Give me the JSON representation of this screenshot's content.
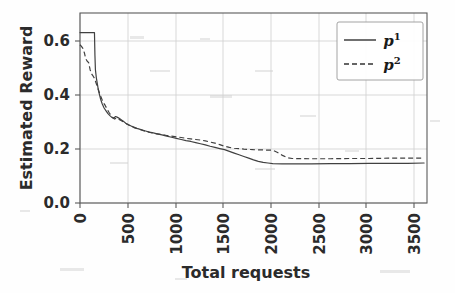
{
  "chart_data": {
    "type": "line",
    "title": "",
    "xlabel": "Total requests",
    "ylabel": "Estimated Reward",
    "xlim": [
      0,
      3600
    ],
    "ylim": [
      0.0,
      0.67
    ],
    "grid": true,
    "legend_position": "upper right",
    "xticks": [
      0,
      500,
      1000,
      1500,
      2000,
      2500,
      3000,
      3500
    ],
    "xtick_labels": [
      "0",
      "500",
      "1000",
      "1500",
      "2000",
      "2500",
      "3000",
      "3500"
    ],
    "yticks": [
      0.0,
      0.2,
      0.4,
      0.6
    ],
    "ytick_labels": [
      "0.0",
      "0.2",
      "0.4",
      "0.6"
    ],
    "xtick_rotation": 90,
    "series": [
      {
        "name": "p1",
        "label_base": "p",
        "label_sup": "1",
        "style": "solid",
        "color": "#404040",
        "x": [
          0,
          20,
          60,
          100,
          140,
          150,
          155,
          160,
          170,
          180,
          190,
          200,
          215,
          230,
          250,
          270,
          290,
          310,
          330,
          350,
          370,
          390,
          410,
          430,
          450,
          480,
          510,
          540,
          570,
          600,
          640,
          680,
          720,
          760,
          800,
          850,
          900,
          950,
          1000,
          1050,
          1100,
          1150,
          1200,
          1250,
          1300,
          1350,
          1400,
          1450,
          1500,
          1550,
          1600,
          1650,
          1700,
          1750,
          1800,
          1850,
          1900,
          1950,
          2000,
          2100,
          2200,
          2400,
          2600,
          2800,
          3000,
          3200,
          3400,
          3570
        ],
        "y": [
          0.601,
          0.601,
          0.601,
          0.601,
          0.601,
          0.601,
          0.52,
          0.47,
          0.44,
          0.42,
          0.4,
          0.385,
          0.365,
          0.35,
          0.335,
          0.325,
          0.315,
          0.308,
          0.302,
          0.3,
          0.305,
          0.302,
          0.298,
          0.293,
          0.288,
          0.28,
          0.275,
          0.27,
          0.266,
          0.262,
          0.258,
          0.254,
          0.25,
          0.247,
          0.244,
          0.24,
          0.236,
          0.232,
          0.228,
          0.224,
          0.22,
          0.217,
          0.213,
          0.209,
          0.205,
          0.2,
          0.196,
          0.192,
          0.188,
          0.182,
          0.176,
          0.17,
          0.164,
          0.158,
          0.152,
          0.147,
          0.143,
          0.141,
          0.139,
          0.138,
          0.138,
          0.138,
          0.139,
          0.139,
          0.14,
          0.14,
          0.14,
          0.141
        ]
      },
      {
        "name": "p2",
        "label_base": "p",
        "label_sup": "2",
        "style": "dashed",
        "color": "#404040",
        "x": [
          0,
          15,
          30,
          45,
          60,
          75,
          90,
          105,
          120,
          135,
          150,
          165,
          180,
          195,
          210,
          225,
          240,
          260,
          280,
          300,
          320,
          340,
          360,
          380,
          400,
          430,
          460,
          490,
          520,
          560,
          600,
          650,
          700,
          750,
          800,
          850,
          900,
          950,
          1000,
          1050,
          1100,
          1150,
          1200,
          1250,
          1300,
          1350,
          1400,
          1450,
          1500,
          1550,
          1600,
          1700,
          1800,
          1900,
          2000,
          2050,
          2100,
          2150,
          2200,
          2400,
          2600,
          2800,
          3000,
          3200,
          3400,
          3570
        ],
        "y": [
          0.558,
          0.552,
          0.545,
          0.53,
          0.508,
          0.5,
          0.495,
          0.47,
          0.455,
          0.448,
          0.44,
          0.425,
          0.41,
          0.395,
          0.38,
          0.368,
          0.355,
          0.345,
          0.332,
          0.32,
          0.31,
          0.3,
          0.296,
          0.3,
          0.296,
          0.29,
          0.284,
          0.278,
          0.272,
          0.266,
          0.262,
          0.256,
          0.251,
          0.247,
          0.244,
          0.241,
          0.238,
          0.236,
          0.233,
          0.231,
          0.228,
          0.226,
          0.224,
          0.222,
          0.219,
          0.215,
          0.211,
          0.206,
          0.2,
          0.196,
          0.193,
          0.19,
          0.188,
          0.187,
          0.186,
          0.178,
          0.168,
          0.16,
          0.157,
          0.156,
          0.156,
          0.157,
          0.157,
          0.158,
          0.158,
          0.158
        ]
      }
    ]
  }
}
